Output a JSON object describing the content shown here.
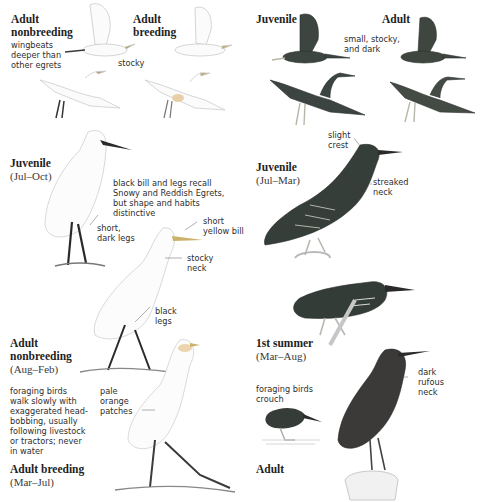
{
  "plate": {
    "left_species": {
      "flight": {
        "adult_nonbreeding": {
          "label": "Adult nonbreeding",
          "line1": "Adult",
          "line2": "nonbreeding",
          "note": [
            "wingbeats",
            "deeper than",
            "other egrets"
          ]
        },
        "adult_breeding": {
          "label": "Adult breeding",
          "line1": "Adult",
          "line2": "breeding"
        },
        "shared_note": "stocky"
      },
      "juvenile": {
        "label": "Juvenile",
        "season": "(Jul–Oct)",
        "note_bill_legs": [
          "black bill and legs recall",
          "Snowy and Reddish Egrets,",
          "but shape and habits",
          "distinctive"
        ],
        "note_legs": [
          "short,",
          "dark legs"
        ]
      },
      "adult_nonbreeding": {
        "line1": "Adult",
        "line2": "nonbreeding",
        "season": "(Aug–Feb)",
        "note_bill": [
          "short",
          "yellow bill"
        ],
        "note_neck": [
          "stocky",
          "neck"
        ],
        "note_legs": [
          "black",
          "legs"
        ],
        "note_foraging": [
          "foraging birds",
          "walk slowly with",
          "exaggerated head-",
          "bobbing, usually",
          "following livestock",
          "or tractors; never",
          "in water"
        ]
      },
      "adult_breeding": {
        "label": "Adult breeding",
        "season": "(Mar–Jul)",
        "note_patches": [
          "pale",
          "orange",
          "patches"
        ]
      }
    },
    "right_species": {
      "flight": {
        "juvenile": {
          "label": "Juvenile"
        },
        "adult": {
          "label": "Adult"
        },
        "shared_note": [
          "small, stocky,",
          "and dark"
        ]
      },
      "juvenile": {
        "label": "Juvenile",
        "season": "(Jul–Mar)",
        "note_crest": [
          "slight",
          "crest"
        ],
        "note_neck": [
          "streaked",
          "neck"
        ]
      },
      "first_summer": {
        "label": "1st summer",
        "season": "(Mar–Aug)"
      },
      "adult": {
        "label": "Adult",
        "note_foraging": [
          "foraging birds",
          "crouch"
        ],
        "note_neck": [
          "dark",
          "rufous",
          "neck"
        ]
      }
    },
    "colors": {
      "background": "#ffffff",
      "heron_dark": "#3b4540",
      "heron_streak": "#cfd2c8",
      "egret_line": "#c8c8c8",
      "leg_dark": "#2a2a2a",
      "rufous": "#4a3a36"
    }
  }
}
